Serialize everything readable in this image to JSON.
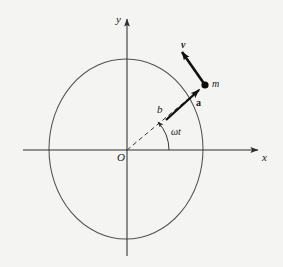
{
  "figure": {
    "background_color": "#f4f4f3",
    "stroke_color": "#3a3a3a",
    "vector_color": "#111111",
    "width": 283,
    "height": 267
  },
  "axes": {
    "x_label": "x",
    "y_label": "y",
    "origin_label": "O",
    "x_axis_name": "horizontal-axis",
    "y_axis_name": "vertical-axis",
    "x_arrow_icon": "arrow-right-icon",
    "y_arrow_icon": "arrow-up-icon"
  },
  "circle": {
    "name": "trajectory-circle",
    "center_x": 126,
    "center_y": 149,
    "radius_x": 77,
    "radius_y": 90,
    "stroke": "#4a4a4a"
  },
  "particle": {
    "label": "m",
    "dot_name": "particle-dot",
    "x": 205,
    "y": 85
  },
  "vectors": [
    {
      "name": "velocity-vector",
      "label": "v",
      "label_x": 182,
      "label_y": 40,
      "from_x": 205,
      "from_y": 85,
      "to_x": 180,
      "to_y": 50,
      "description": "tangential velocity"
    },
    {
      "name": "acceleration-vector",
      "label": "a",
      "label_x": 197,
      "label_y": 99,
      "from_x": 168,
      "from_y": 118,
      "to_x": 202,
      "to_y": 88,
      "description": "centripetal acceleration pointing toward m"
    }
  ],
  "radius_line": {
    "name": "radius-dashed-line",
    "label": "b",
    "label_x": 158,
    "label_y": 106,
    "from_x": 127,
    "from_y": 150,
    "to_x": 205,
    "to_y": 85
  },
  "angle": {
    "name": "angle-arc",
    "label": "ωt",
    "label_x": 172,
    "label_y": 128,
    "arc_radius": 42,
    "degrees": 40
  }
}
